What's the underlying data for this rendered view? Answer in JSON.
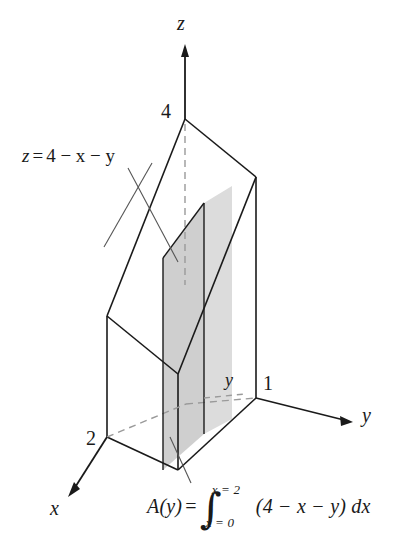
{
  "figure": {
    "background": "#ffffff",
    "line_color": "#1a1a1a",
    "shade_color_front": "#d8d8d8",
    "shade_color_side": "#c9c9c9",
    "dashed_color": "#9a9a9a"
  },
  "axes": {
    "z_label": "z",
    "y_label": "y",
    "x_label": "x"
  },
  "ticks": {
    "z_four": "4",
    "x_two": "2",
    "y_one": "1",
    "slab_y": "y"
  },
  "plane": {
    "equation_z": "z",
    "equation_eq": "=",
    "equation_rhs": "4 − x − y",
    "full": "z = 4 − x − y"
  },
  "cross_section": {
    "name": "A(y)",
    "equals": "=",
    "integral_symbol": "∫",
    "upper_limit": "x = 2",
    "lower_limit": "x = 0",
    "integrand": "(4 − x − y) dx"
  },
  "geometry": {
    "apex_z4": [
      185,
      119
    ],
    "origin": [
      256,
      398
    ],
    "x_intercept_2": [
      107,
      437
    ],
    "y_intercept_1": [
      256,
      398
    ],
    "right_top": [
      256,
      177
    ],
    "left_front_top": [
      107,
      316
    ],
    "slab_front_x": [
      163,
      204
    ],
    "note": "isometric projection, hidden edges dashed"
  }
}
